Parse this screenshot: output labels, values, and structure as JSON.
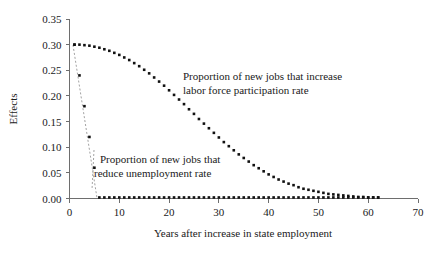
{
  "chart_data": {
    "type": "scatter",
    "title": "",
    "xlabel": "Years after increase in state employment",
    "ylabel": "Effects",
    "xlim": [
      0,
      70
    ],
    "ylim": [
      0.0,
      0.35
    ],
    "xticks": [
      "0",
      "10",
      "20",
      "30",
      "40",
      "50",
      "60",
      "70"
    ],
    "xtick_values": [
      0,
      10,
      20,
      30,
      40,
      50,
      60,
      70
    ],
    "yticks": [
      "0.00",
      "0.05",
      "0.10",
      "0.15",
      "0.20",
      "0.25",
      "0.30",
      "0.35"
    ],
    "ytick_values": [
      0.0,
      0.05,
      0.1,
      0.15,
      0.2,
      0.25,
      0.3,
      0.35
    ],
    "grid": false,
    "legend_position": "none",
    "marker_color": "#111111",
    "axis_color": "#6e6e6e",
    "background_color": "#ffffff",
    "series": [
      {
        "name": "Proportion of new jobs that increase labor force participation rate",
        "marker": "square",
        "x": [
          1,
          2,
          3,
          4,
          5,
          6,
          7,
          8,
          9,
          10,
          11,
          12,
          13,
          14,
          15,
          16,
          17,
          18,
          19,
          20,
          21,
          22,
          23,
          24,
          25,
          26,
          27,
          28,
          29,
          30,
          31,
          32,
          33,
          34,
          35,
          36,
          37,
          38,
          39,
          40,
          41,
          42,
          43,
          44,
          45,
          46,
          47,
          48,
          49,
          50,
          51,
          52,
          53,
          54,
          55,
          56,
          57,
          58,
          59,
          60,
          61,
          62
        ],
        "values": [
          0.3,
          0.3,
          0.299,
          0.298,
          0.296,
          0.294,
          0.291,
          0.288,
          0.284,
          0.28,
          0.275,
          0.27,
          0.264,
          0.258,
          0.251,
          0.244,
          0.236,
          0.228,
          0.22,
          0.211,
          0.202,
          0.193,
          0.184,
          0.174,
          0.165,
          0.155,
          0.146,
          0.137,
          0.128,
          0.119,
          0.11,
          0.102,
          0.094,
          0.086,
          0.079,
          0.072,
          0.065,
          0.059,
          0.053,
          0.047,
          0.042,
          0.037,
          0.033,
          0.029,
          0.026,
          0.022,
          0.019,
          0.017,
          0.015,
          0.013,
          0.011,
          0.009,
          0.008,
          0.007,
          0.006,
          0.005,
          0.004,
          0.003,
          0.003,
          0.002,
          0.002,
          0.002
        ]
      },
      {
        "name": "Proportion of new jobs that reduce unemployment rate",
        "marker": "square",
        "x": [
          1,
          2,
          3,
          4,
          5,
          6,
          7,
          8,
          9,
          10,
          11,
          12,
          13,
          14,
          15,
          16,
          17,
          18,
          19,
          20,
          21,
          22,
          23,
          24,
          25,
          26,
          27,
          28,
          29,
          30,
          31,
          32,
          33,
          34,
          35,
          36,
          37,
          38,
          39,
          40,
          41,
          42,
          43,
          44,
          45,
          46,
          47,
          48,
          49,
          50,
          51,
          52,
          53,
          54,
          55,
          56,
          57,
          58,
          59,
          60,
          61,
          62
        ],
        "values": [
          0.3,
          0.24,
          0.18,
          0.12,
          0.06,
          0.002,
          0.002,
          0.002,
          0.002,
          0.002,
          0.002,
          0.002,
          0.002,
          0.002,
          0.002,
          0.002,
          0.002,
          0.002,
          0.002,
          0.002,
          0.002,
          0.002,
          0.002,
          0.002,
          0.002,
          0.002,
          0.002,
          0.002,
          0.002,
          0.002,
          0.002,
          0.002,
          0.002,
          0.002,
          0.002,
          0.002,
          0.002,
          0.002,
          0.002,
          0.002,
          0.002,
          0.002,
          0.002,
          0.002,
          0.002,
          0.002,
          0.002,
          0.002,
          0.002,
          0.002,
          0.002,
          0.002,
          0.002,
          0.002,
          0.002,
          0.002,
          0.002,
          0.002,
          0.002,
          0.002,
          0.002,
          0.002
        ]
      }
    ],
    "annotations": [
      {
        "id": "lfp",
        "line1": "Proportion of new jobs that increase",
        "line2": "labor force participation rate"
      },
      {
        "id": "unemployment",
        "line1": "Proportion of new jobs that",
        "line2": "reduce unemployment rate"
      }
    ]
  }
}
